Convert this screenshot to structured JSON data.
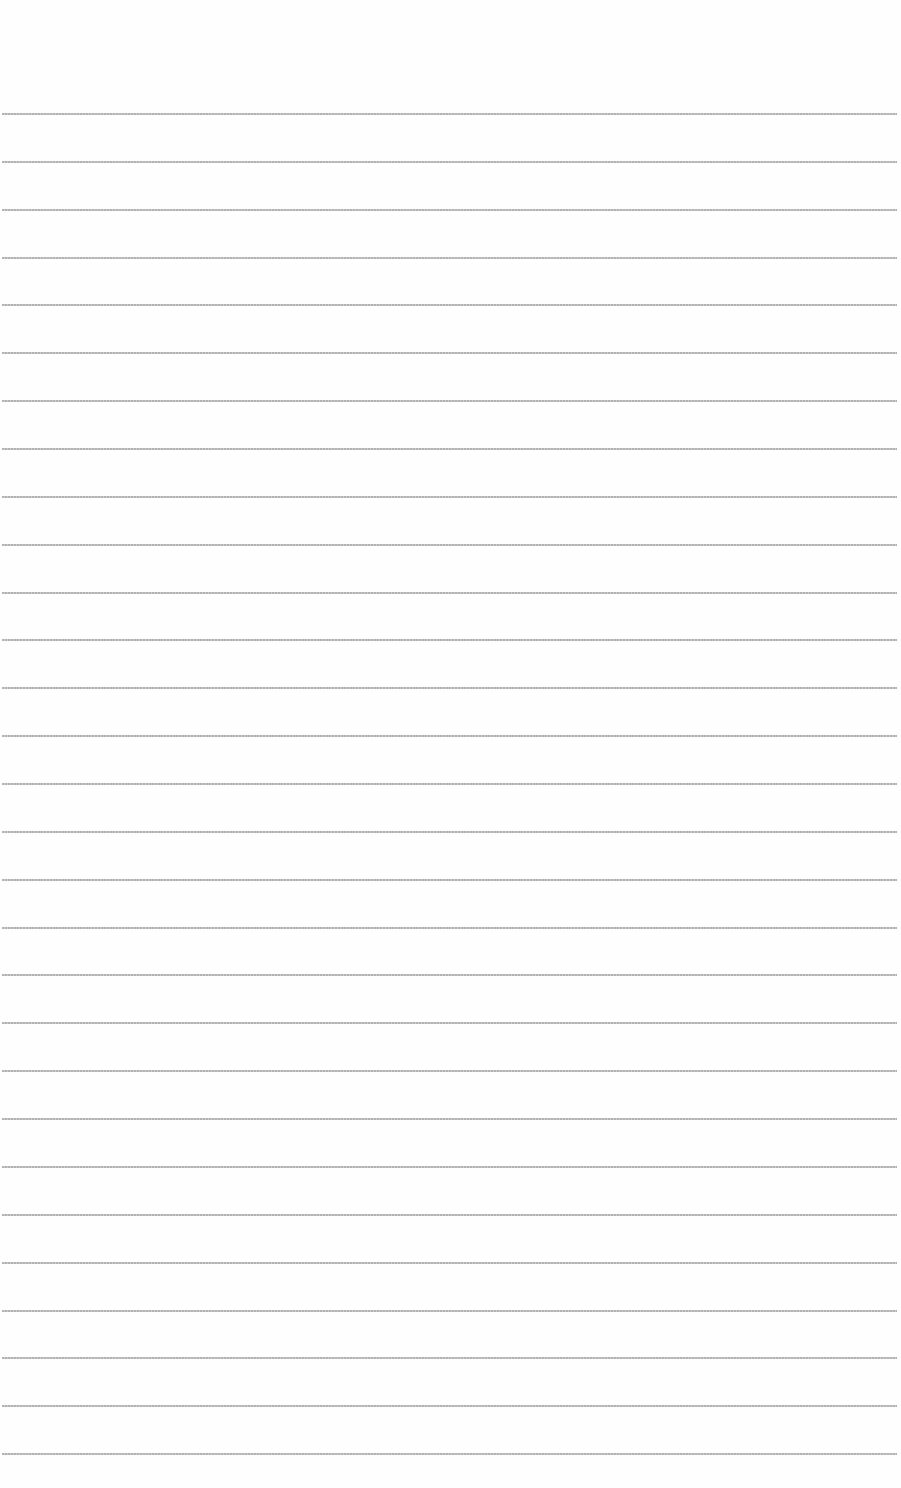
{
  "page": {
    "type": "lined-paper",
    "background": "#fefefe",
    "rule_color": "#b0b0b0",
    "rule_count": 29,
    "first_rule_y": 113,
    "rule_spacing": 47.86,
    "rules": []
  }
}
